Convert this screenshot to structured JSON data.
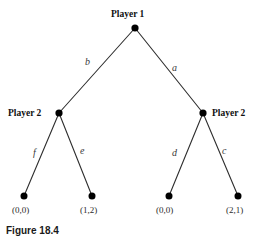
{
  "figure": {
    "caption": "Figure 18.4",
    "type": "extensive-form-game-tree",
    "line_color": "#2e2e2e",
    "node_color": "#000000",
    "background_color": "#ffffff"
  },
  "nodes": [
    {
      "id": "root",
      "label": "Player 1",
      "x": 135,
      "y": 28,
      "kind": "decision",
      "label_position": "above"
    },
    {
      "id": "left",
      "label": "Player 2",
      "x": 59,
      "y": 113,
      "kind": "decision",
      "label_position": "left"
    },
    {
      "id": "right",
      "label": "Player 2",
      "x": 203,
      "y": 113,
      "kind": "decision",
      "label_position": "right"
    },
    {
      "id": "t1",
      "label": "",
      "x": 24,
      "y": 196,
      "kind": "terminal",
      "label_position": "below"
    },
    {
      "id": "t2",
      "label": "",
      "x": 92,
      "y": 196,
      "kind": "terminal",
      "label_position": "below"
    },
    {
      "id": "t3",
      "label": "",
      "x": 169,
      "y": 196,
      "kind": "terminal",
      "label_position": "below"
    },
    {
      "id": "t4",
      "label": "",
      "x": 238,
      "y": 196,
      "kind": "terminal",
      "label_position": "below"
    }
  ],
  "edges": [
    {
      "id": "e-b",
      "from": "root",
      "to": "left",
      "label": "b"
    },
    {
      "id": "e-a",
      "from": "root",
      "to": "right",
      "label": "a"
    },
    {
      "id": "e-f",
      "from": "left",
      "to": "t1",
      "label": "f"
    },
    {
      "id": "e-e",
      "from": "left",
      "to": "t2",
      "label": "e"
    },
    {
      "id": "e-d",
      "from": "right",
      "to": "t3",
      "label": "d"
    },
    {
      "id": "e-c",
      "from": "right",
      "to": "t4",
      "label": "c"
    }
  ],
  "payoffs": [
    {
      "node": "t1",
      "text": "(0,0)"
    },
    {
      "node": "t2",
      "text": "(1,2)"
    },
    {
      "node": "t3",
      "text": "(0,0)"
    },
    {
      "node": "t4",
      "text": "(2,1)"
    }
  ]
}
